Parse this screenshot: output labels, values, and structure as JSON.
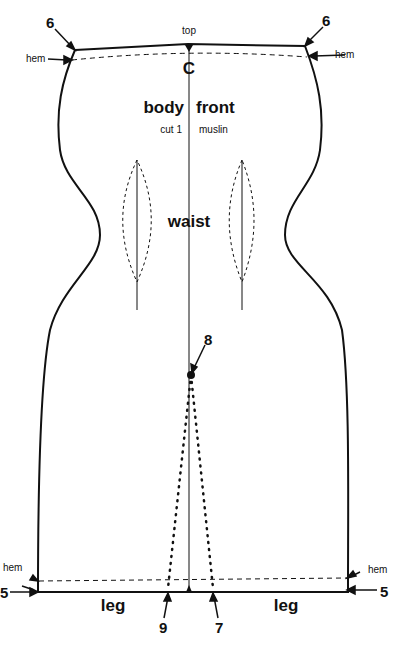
{
  "pattern": {
    "title_left": "body",
    "title_right": "front",
    "subtitle_left": "cut 1",
    "subtitle_right": "muslin",
    "center_mark": "C",
    "top_label": "top",
    "waist_label": "waist",
    "hem_labels": [
      "hem",
      "hem",
      "hem",
      "hem"
    ],
    "leg_labels": [
      "leg",
      "leg"
    ],
    "point_numbers": {
      "top_left": "6",
      "top_right": "6",
      "bottom_left": "5",
      "bottom_right": "5",
      "dot_point": "8",
      "left_slit": "9",
      "right_slit": "7"
    }
  }
}
